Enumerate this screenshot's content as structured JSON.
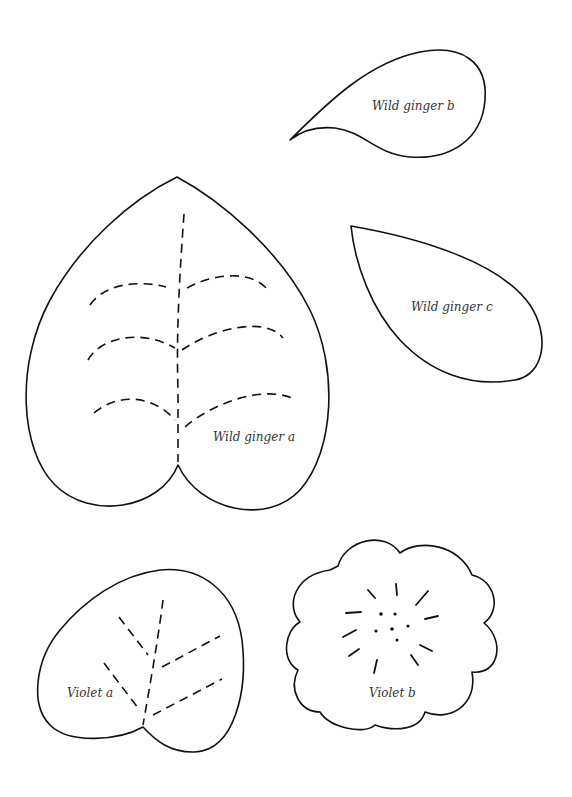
{
  "page": {
    "background": "#ffffff",
    "line_color": "#111111"
  },
  "pattern_pieces": {
    "wild_ginger_a": {
      "label": "Wild ginger a",
      "type": "heart-shaped leaf with dashed midrib and 3 pairs of dashed veins"
    },
    "wild_ginger_b": {
      "label": "Wild ginger b",
      "type": "small teardrop leaf"
    },
    "wild_ginger_c": {
      "label": "Wild ginger c",
      "type": "teardrop leaf"
    },
    "violet_a": {
      "label": "Violet a",
      "type": "rounded leaf with dashed midrib and 4 dashed veins"
    },
    "violet_b": {
      "label": "Violet b",
      "type": "scalloped flower with radial stitch marks and center dots"
    }
  }
}
